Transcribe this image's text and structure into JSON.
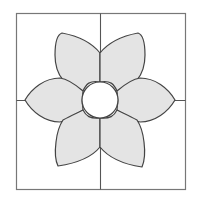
{
  "diagram": {
    "title": "",
    "colors": {
      "background": "#ffffff",
      "stroke": "#555555",
      "frame": "#777777",
      "petal_fill": "#e4e4e4",
      "center_fill": "#ffffff"
    },
    "frame": {
      "x": 16,
      "y": 13,
      "width": 169,
      "height": 176
    },
    "center": {
      "cx": 100,
      "cy": 100,
      "r": 18
    },
    "petal_count": 6,
    "petals": [
      {
        "name": "petal-left",
        "tip": [
          25,
          100
        ]
      },
      {
        "name": "petal-upper-left",
        "tip": [
          61,
          33
        ]
      },
      {
        "name": "petal-upper-right",
        "tip": [
          138,
          33
        ]
      },
      {
        "name": "petal-right",
        "tip": [
          175,
          100
        ]
      },
      {
        "name": "petal-lower-right",
        "tip": [
          142,
          167
        ]
      },
      {
        "name": "petal-lower-left",
        "tip": [
          58,
          166
        ]
      }
    ]
  }
}
